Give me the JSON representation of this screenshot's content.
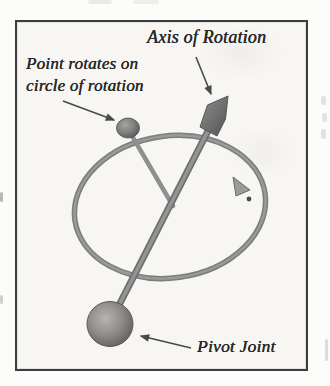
{
  "figure": {
    "labels": {
      "axis": "Axis of Rotation",
      "point_line1": "Point rotates on",
      "point_line2": "circle of rotation",
      "pivot": "Pivot Joint"
    },
    "colors": {
      "ink": "#2a2a2a",
      "border": "#3d3d3d",
      "paper": "#f7f6f3",
      "page": "#fcfcfb",
      "metal": "#8a8a8a",
      "metal_dark": "#5f5f5f"
    }
  }
}
